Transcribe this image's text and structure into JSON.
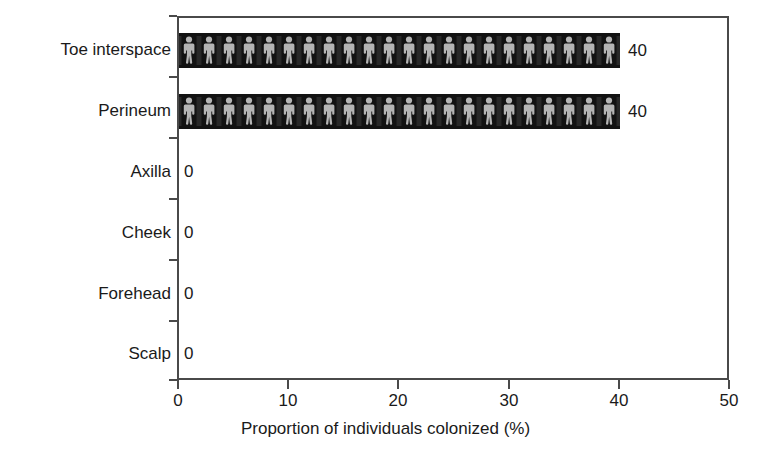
{
  "chart_data": {
    "type": "bar",
    "orientation": "horizontal",
    "title": "",
    "subtitle": "",
    "xlabel": "Proportion of individuals colonized (%)",
    "ylabel": "",
    "categories": [
      "Toe interspace",
      "Perineum",
      "Axilla",
      "Cheek",
      "Forehead",
      "Scalp"
    ],
    "values": [
      40,
      40,
      0,
      0,
      0,
      0
    ],
    "data_labels": [
      "40",
      "40",
      "0",
      "0",
      "0",
      "0"
    ],
    "xlim": [
      0,
      50
    ],
    "xticks": [
      0,
      10,
      20,
      30,
      40,
      50
    ],
    "xticklabels": [
      "0",
      "10",
      "20",
      "30",
      "40",
      "50"
    ],
    "grid": false,
    "legend": null,
    "bar_fill": "#121212",
    "bar_pattern": "human-figure-pictogram",
    "pattern_color": "#b5b5b5",
    "axis_color": "#4a4a4a",
    "text_color": "#1a1a1a"
  },
  "axis": {
    "x_title": "Proportion of individuals colonized (%)",
    "tick_labels": [
      "0",
      "10",
      "20",
      "30",
      "40",
      "50"
    ]
  },
  "rows": [
    {
      "label": "Toe interspace",
      "value_label": "40",
      "value": 40
    },
    {
      "label": "Perineum",
      "value_label": "40",
      "value": 40
    },
    {
      "label": "Axilla",
      "value_label": "0",
      "value": 0
    },
    {
      "label": "Cheek",
      "value_label": "0",
      "value": 0
    },
    {
      "label": "Forehead",
      "value_label": "0",
      "value": 0
    },
    {
      "label": "Scalp",
      "value_label": "0",
      "value": 0
    }
  ]
}
